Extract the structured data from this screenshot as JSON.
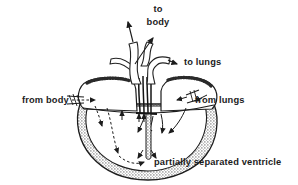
{
  "colors": {
    "ink": "#1c1c1c",
    "background": "#ffffff"
  },
  "labels": {
    "to_body": {
      "line1": "to",
      "line2": "body"
    },
    "to_lungs": "to lungs",
    "from_body": "from body",
    "from_lungs": "from lungs",
    "caption": "partially separated ventricle"
  }
}
